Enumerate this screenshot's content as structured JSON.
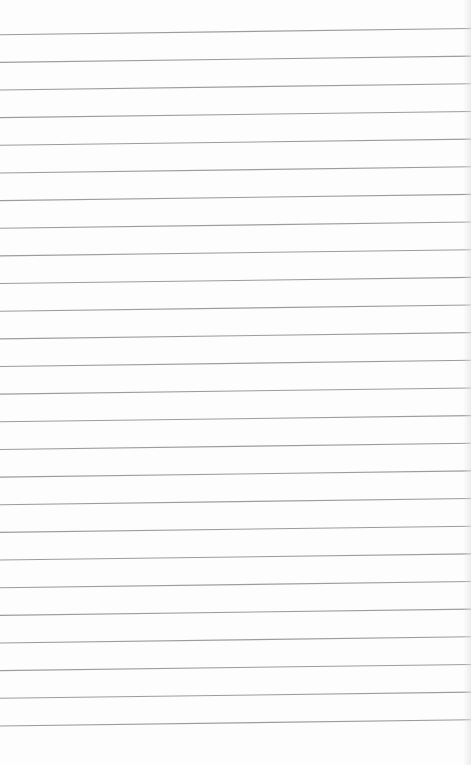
{
  "paper": {
    "type": "lined-notepad",
    "text": "",
    "background_color": "#fdfdfd",
    "line_color": "#9c9c9c",
    "line_count": 26,
    "first_line_y_left": 34.7,
    "first_line_y_right": 28.5,
    "line_spacing": 27.65
  }
}
